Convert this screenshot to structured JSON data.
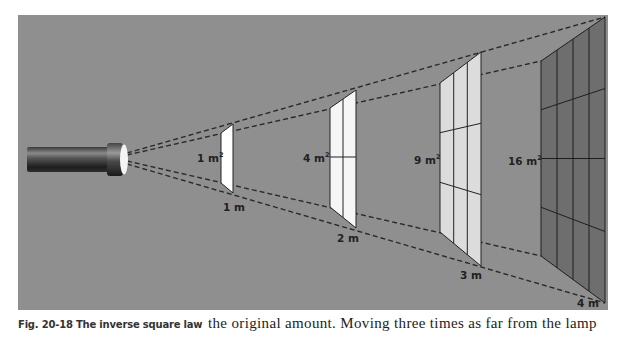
{
  "figure": {
    "caption": "Fig. 20-18 The inverse square law",
    "background_color": "#8f8f8f",
    "dash_color": "#2a2a2a",
    "light_source": "flashlight-lamp",
    "panels": [
      {
        "distance_label": "1 m",
        "area_label": "1 m",
        "area_exponent": "2",
        "grid": 1,
        "fill": "#ffffff"
      },
      {
        "distance_label": "2 m",
        "area_label": "4 m",
        "area_exponent": "2",
        "grid": 2,
        "fill": "#f6f6f6"
      },
      {
        "distance_label": "3 m",
        "area_label": "9 m",
        "area_exponent": "2",
        "grid": 3,
        "fill": "#dcdcdc"
      },
      {
        "distance_label": "4 m",
        "area_label": "16 m",
        "area_exponent": "2",
        "grid": 4,
        "fill": "#6e6e6e"
      }
    ]
  },
  "body_text": "the original amount. Moving three times as far from the lamp"
}
